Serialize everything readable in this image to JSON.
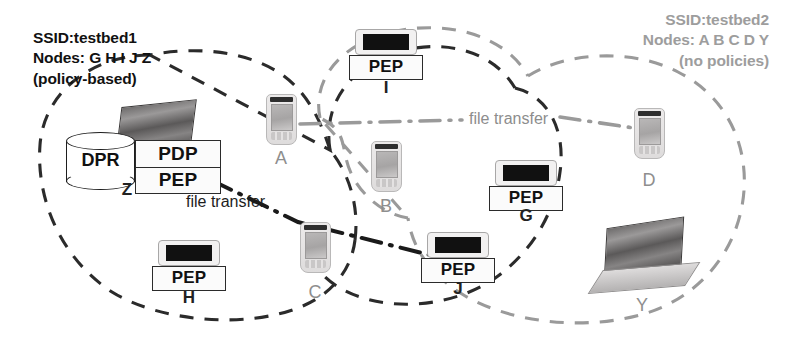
{
  "diagram": {
    "colors": {
      "cloud_testbed1": "#2b2b2b",
      "cloud_testbed2": "#9a9a9a",
      "link_black": "#1a1a1a",
      "link_gray": "#9a9a9a",
      "text_dark": "#111111",
      "text_gray": "#9d9d9d"
    }
  },
  "networks": [
    {
      "id": "testbed1",
      "ssid_line": "SSID:testbed1",
      "nodes_line": "Nodes: G H I J Z",
      "policy_line": "(policy-based)",
      "full_label": "SSID:testbed1\nNodes: G H I J Z\n(policy-based)",
      "style": "black-dashed"
    },
    {
      "id": "testbed2",
      "ssid_line": "SSID:testbed2",
      "nodes_line": "Nodes: A B C D Y",
      "policy_line": "(no policies)",
      "full_label": "SSID:testbed2\nNodes: A B C D Y\n(no policies)",
      "style": "gray-dashed"
    }
  ],
  "nodes": [
    {
      "id": "Z",
      "letter": "Z",
      "device": "laptop-server",
      "network": "testbed1",
      "components": [
        "DPR",
        "PDP",
        "PEP"
      ]
    },
    {
      "id": "H",
      "letter": "H",
      "device": "pda",
      "network": "testbed1",
      "components": [
        "PEP"
      ]
    },
    {
      "id": "I",
      "letter": "I",
      "device": "pda",
      "network": "testbed1",
      "components": [
        "PEP"
      ]
    },
    {
      "id": "G",
      "letter": "G",
      "device": "pda",
      "network": "testbed1",
      "components": [
        "PEP"
      ]
    },
    {
      "id": "J",
      "letter": "J",
      "device": "pda",
      "network": "testbed1",
      "components": [
        "PEP"
      ]
    },
    {
      "id": "A",
      "letter": "A",
      "device": "pda",
      "network": "testbed2",
      "components": []
    },
    {
      "id": "B",
      "letter": "B",
      "device": "pda",
      "network": "testbed2",
      "components": []
    },
    {
      "id": "C",
      "letter": "C",
      "device": "pda",
      "network": "testbed2",
      "components": []
    },
    {
      "id": "D",
      "letter": "D",
      "device": "pda",
      "network": "testbed2",
      "components": []
    },
    {
      "id": "Y",
      "letter": "Y",
      "device": "laptop",
      "network": "testbed2",
      "components": []
    }
  ],
  "components": {
    "dpr": "DPR",
    "pdp": "PDP",
    "pep": "PEP"
  },
  "boxes": {
    "z_pdp": "PDP",
    "z_pep": "PEP",
    "h_pep": "PEP",
    "i_pep": "PEP",
    "g_pep": "PEP",
    "j_pep": "PEP"
  },
  "node_letters": {
    "z": "Z",
    "h": "H",
    "i": "I",
    "g": "G",
    "j": "J",
    "a": "A",
    "b": "B",
    "c": "C",
    "d": "D",
    "y": "Y"
  },
  "flows": [
    {
      "id": "flow-top",
      "label": "file transfer",
      "from": "A",
      "to": "D",
      "color": "#8d8d8d",
      "line_style": "dash-dot"
    },
    {
      "id": "flow-bottom",
      "label": "file transfer",
      "from": "Z",
      "to": "J",
      "color": "#1d1d1d",
      "line_style": "dash-dot"
    }
  ]
}
